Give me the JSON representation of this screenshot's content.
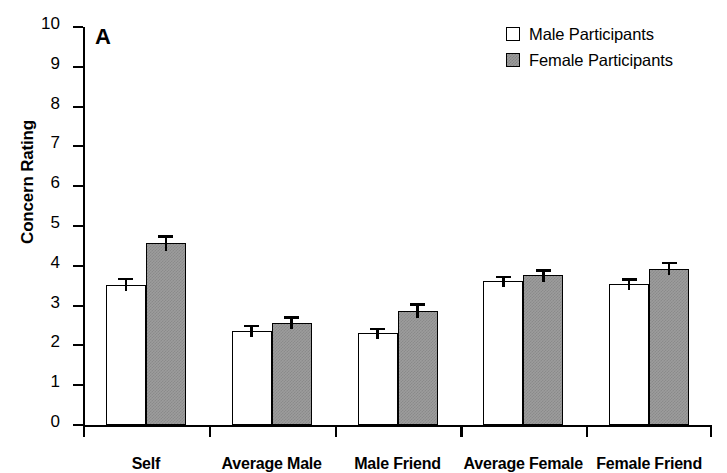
{
  "panel": {
    "letter": "A"
  },
  "legend": {
    "position": "top-right",
    "items": [
      {
        "label": "Male Participants",
        "swatch": "open-square-icon",
        "color": "#ffffff"
      },
      {
        "label": "Female Participants",
        "swatch": "filled-square-icon",
        "color": "#9c9c9c"
      }
    ]
  },
  "axes": {
    "ylabel": "Concern Rating",
    "xlabel": "",
    "yticks": [
      10,
      9,
      8,
      7,
      6,
      5,
      4,
      3,
      2,
      1,
      0
    ],
    "ylim": [
      0,
      10
    ]
  },
  "chart_data": {
    "type": "bar",
    "title": "A",
    "xlabel": "",
    "ylabel": "Concern Rating",
    "ylim": [
      0,
      10
    ],
    "grid": false,
    "legend_position": "top-right",
    "categories": [
      "Self",
      "Average Male",
      "Male Friend",
      "Average Female",
      "Female Friend"
    ],
    "series": [
      {
        "name": "Male Participants",
        "color": "#ffffff",
        "values": [
          3.53,
          2.37,
          2.3,
          3.61,
          3.54
        ],
        "errors": [
          0.17,
          0.15,
          0.14,
          0.14,
          0.15
        ]
      },
      {
        "name": "Female Participants",
        "color": "#9c9c9c",
        "values": [
          4.57,
          2.57,
          2.87,
          3.76,
          3.93
        ],
        "errors": [
          0.2,
          0.17,
          0.19,
          0.16,
          0.17
        ]
      }
    ]
  }
}
